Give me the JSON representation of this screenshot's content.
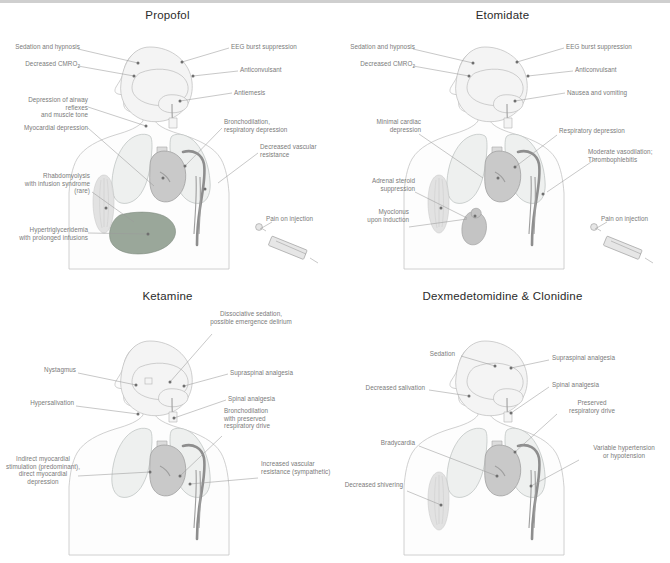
{
  "figure": {
    "background_color": "#ffffff",
    "label_color": "#7a7a7a",
    "title_color": "#2b2b2b",
    "accent_organ_colors": {
      "lung": "#eef0ef",
      "heart": "#c9c9c9",
      "aorta": "#8e8e8e",
      "liver": "#9aa79a",
      "kidney_adrenal": "#c4c4c4",
      "muscle": "#dedede"
    }
  },
  "panels": [
    {
      "id": "propofol",
      "title": "Propofol",
      "labels": [
        {
          "name": "sedation-and-hypnosis",
          "text": "Sedation and hypnosis"
        },
        {
          "name": "decreased-cmro2",
          "text": "Decreased CMRO",
          "sub": "2"
        },
        {
          "name": "depression-of-airway-reflexes",
          "text": "Depression of airway reflexes\nand muscle tone"
        },
        {
          "name": "myocardial-depression",
          "text": "Myocardial depression"
        },
        {
          "name": "rhabdomyolysis",
          "text": "Rhabdomyolysis\nwith infusion syndrome\n(rare)"
        },
        {
          "name": "hypertriglyceridemia",
          "text": "Hypertriglyceridemia\nwith prolonged infusions"
        },
        {
          "name": "eeg-burst-suppression",
          "text": "EEG burst suppression"
        },
        {
          "name": "anticonvulsant",
          "text": "Anticonvulsant"
        },
        {
          "name": "antiemesis",
          "text": "Antiemesis"
        },
        {
          "name": "bronchodilation",
          "text": "Bronchodilation,\nrespiratory depression"
        },
        {
          "name": "decreased-vascular-resistance",
          "text": "Decreased vascular\nresistance"
        },
        {
          "name": "pain-on-injection",
          "text": "Pain on injection"
        }
      ]
    },
    {
      "id": "etomidate",
      "title": "Etomidate",
      "labels": [
        {
          "name": "sedation-and-hypnosis",
          "text": "Sedation and hypnosis"
        },
        {
          "name": "decreased-cmro2",
          "text": "Decreased CMRO",
          "sub": "2"
        },
        {
          "name": "minimal-cardiac-depression",
          "text": "Minimal cardiac\ndepression"
        },
        {
          "name": "adrenal-steroid-suppression",
          "text": "Adrenal steroid\nsuppression"
        },
        {
          "name": "myoclonus-upon-induction",
          "text": "Myoclonus\nupon induction"
        },
        {
          "name": "eeg-burst-suppression",
          "text": "EEG burst suppression"
        },
        {
          "name": "anticonvulsant",
          "text": "Anticonvulsant"
        },
        {
          "name": "nausea-and-vomiting",
          "text": "Nausea and vomiting"
        },
        {
          "name": "respiratory-depression",
          "text": "Respiratory depression"
        },
        {
          "name": "moderate-vasodilation",
          "text": "Moderate vasodilation;\nThrombophlebitis"
        },
        {
          "name": "pain-on-injection",
          "text": "Pain on injection"
        }
      ]
    },
    {
      "id": "ketamine",
      "title": "Ketamine",
      "labels": [
        {
          "name": "dissociative-sedation",
          "text": "Dissociative sedation,\npossible emergence delirium"
        },
        {
          "name": "nystagmus",
          "text": "Nystagmus"
        },
        {
          "name": "hypersalivation",
          "text": "Hypersalivation"
        },
        {
          "name": "indirect-myocardial-stimulation",
          "text": "Indirect myocardial\nstimulation (predominant),\ndirect myocardial\ndepression"
        },
        {
          "name": "supraspinal-analgesia",
          "text": "Supraspinal analgesia"
        },
        {
          "name": "spinal-analgesia",
          "text": "Spinal analgesia"
        },
        {
          "name": "bronchodilation-preserved-drive",
          "text": "Bronchodilation\nwith preserved\nrespiratory drive"
        },
        {
          "name": "increased-vascular-resistance",
          "text": "Increased vascular\nresistance (sympathetic)"
        }
      ]
    },
    {
      "id": "dexmedetomidine-clonidine",
      "title": "Dexmedetomidine & Clonidine",
      "labels": [
        {
          "name": "sedation",
          "text": "Sedation"
        },
        {
          "name": "decreased-salivation",
          "text": "Decreased salivation"
        },
        {
          "name": "bradycardia",
          "text": "Bradycardia"
        },
        {
          "name": "decreased-shivering",
          "text": "Decreased shivering"
        },
        {
          "name": "supraspinal-analgesia",
          "text": "Supraspinal analgesia"
        },
        {
          "name": "spinal-analgesia",
          "text": "Spinal analgesia"
        },
        {
          "name": "preserved-respiratory-drive",
          "text": "Preserved\nrespiratory drive"
        },
        {
          "name": "variable-hypertension",
          "text": "Variable hypertension\nor hypotension"
        }
      ]
    }
  ]
}
